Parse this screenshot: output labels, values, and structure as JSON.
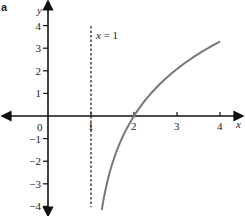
{
  "panel_label": "a",
  "chart_data": {
    "type": "line",
    "title": "",
    "xlabel": "x",
    "ylabel": "y",
    "xlim": [
      -1,
      4.5
    ],
    "ylim": [
      -4.3,
      5
    ],
    "grid": false,
    "legend": null,
    "x_ticks": [
      "0",
      "1",
      "2",
      "3",
      "4"
    ],
    "y_ticks": [
      "4",
      "3",
      "2",
      "1",
      "-1",
      "-2",
      "-3",
      "-4"
    ],
    "y_tick_labels": [
      "4",
      "3",
      "2",
      "1",
      "−1",
      "−2",
      "−3",
      "−4"
    ],
    "series": [
      {
        "name": "curve",
        "color": "#777777",
        "x": [
          1.25,
          1.4,
          1.6,
          1.8,
          2.0,
          2.3,
          2.6,
          3.0,
          3.4,
          3.7,
          4.0
        ],
        "y": [
          -4.16,
          -2.75,
          -1.53,
          -0.67,
          0.0,
          0.79,
          1.41,
          2.08,
          2.63,
          2.98,
          3.3
        ]
      }
    ],
    "annotations": [
      {
        "type": "vertical_asymptote",
        "x": 1,
        "style": "dashed",
        "label": "x = 1"
      }
    ],
    "intercepts": [
      {
        "x": 2,
        "y": 0
      }
    ]
  },
  "labels": {
    "x_axis": "x",
    "y_axis": "y",
    "origin": "0",
    "asymptote": "x = 1"
  }
}
